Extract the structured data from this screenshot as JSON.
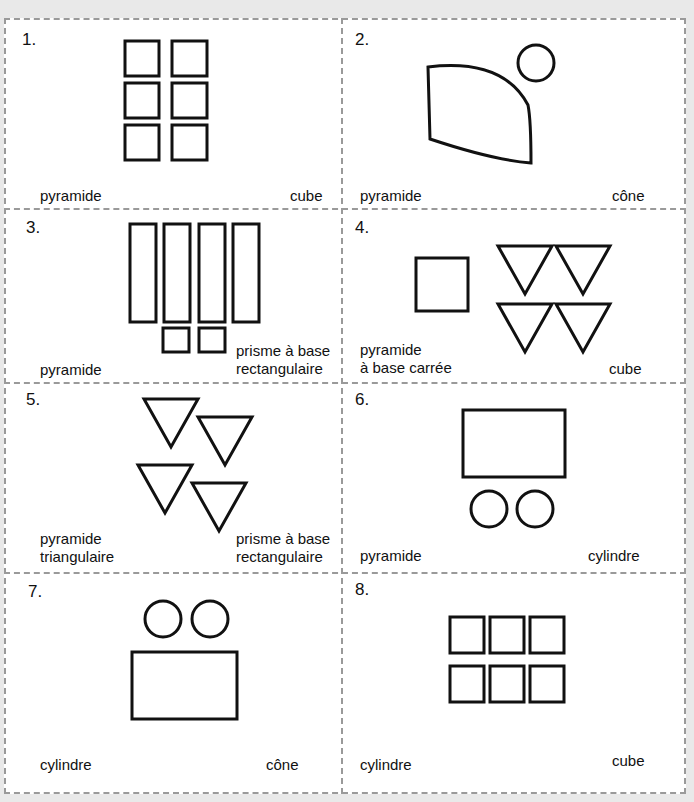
{
  "cards": [
    {
      "number": "1.",
      "left_label": [
        "pyramide"
      ],
      "right_label": [
        "cube"
      ],
      "figure": "net-2x3-squares"
    },
    {
      "number": "2.",
      "left_label": [
        "pyramide"
      ],
      "right_label": [
        "cône"
      ],
      "figure": "net-sector-circle"
    },
    {
      "number": "3.",
      "left_label": [
        "pyramide"
      ],
      "right_label": [
        "prisme à base",
        "rectangulaire"
      ],
      "figure": "net-4-rectangles-2-squares"
    },
    {
      "number": "4.",
      "left_label": [
        "pyramide",
        "à base carrée"
      ],
      "right_label": [
        "cube"
      ],
      "figure": "net-square-4-triangles"
    },
    {
      "number": "5.",
      "left_label": [
        "pyramide",
        "triangulaire"
      ],
      "right_label": [
        "prisme à base",
        "rectangulaire"
      ],
      "figure": "net-4-triangles"
    },
    {
      "number": "6.",
      "left_label": [
        "pyramide"
      ],
      "right_label": [
        "cylindre"
      ],
      "figure": "net-rectangle-2-circles"
    },
    {
      "number": "7.",
      "left_label": [
        "cylindre"
      ],
      "right_label": [
        "cône"
      ],
      "figure": "net-2-circles-rectangle"
    },
    {
      "number": "8.",
      "left_label": [
        "cylindre"
      ],
      "right_label": [
        "cube"
      ],
      "figure": "net-3x2-squares"
    }
  ]
}
